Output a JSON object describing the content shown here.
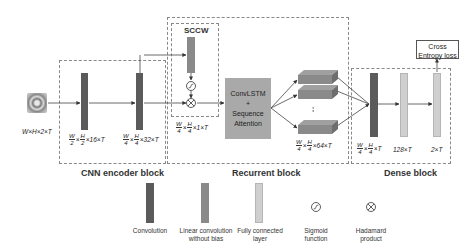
{
  "diagram": {
    "blocks": {
      "cnn": "CNN encoder block",
      "recurrent": "Recurrent block",
      "dense": "Dense block",
      "sccw": "SCCW"
    },
    "input_dim": "W×H×2×T",
    "cnn_dims": [
      {
        "num1": "W",
        "den1": "2",
        "num2": "H",
        "den2": "2",
        "rest": "×16×T"
      },
      {
        "num1": "W",
        "den1": "4",
        "num2": "H",
        "den2": "4",
        "rest": "×32×T"
      }
    ],
    "sccw_dim": {
      "num1": "W",
      "den1": "4",
      "num2": "H",
      "den2": "4",
      "rest": "×1×T"
    },
    "lstm_dim": {
      "num1": "W",
      "den1": "4",
      "num2": "H",
      "den2": "4",
      "rest": "×64×T"
    },
    "dense_dims": [
      {
        "num1": "W",
        "den1": "4",
        "num2": "H",
        "den2": "4",
        "rest": "×T"
      },
      {
        "text": "128×T"
      },
      {
        "text": "2×T"
      }
    ],
    "convlstm": {
      "line1": "ConvLSTM",
      "line2": "+",
      "line3": "Sequence",
      "line4": "Attention"
    },
    "loss": {
      "line1": "Cross",
      "line2": "Entropy loss"
    },
    "ellipsis": "⁞",
    "sigmoid_symbol": "σ",
    "hadamard_symbol": "⊗"
  },
  "legend": [
    {
      "label1": "Convolution",
      "label2": ""
    },
    {
      "label1": "Linear convolution",
      "label2": "without bias"
    },
    {
      "label1": "Fully connected",
      "label2": "layer"
    },
    {
      "label1": "Sigmoid",
      "label2": "function"
    },
    {
      "label1": "Hadamard",
      "label2": "product"
    }
  ],
  "colors": {
    "convolution": "#5b5b5b",
    "linear_conv": "#8a8a8a",
    "fully_connected": "#cfcfcf",
    "convlstm_box": "#a9a9a9"
  }
}
